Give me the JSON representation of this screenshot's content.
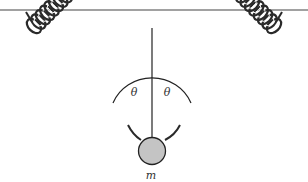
{
  "diagram": {
    "labels": {
      "angle_left": "θ",
      "angle_right": "θ",
      "mass": "m"
    },
    "colors": {
      "line": "#222222",
      "spring": "#2a2a2a",
      "mass_fill": "#c4c4c4",
      "background": "#ffffff"
    },
    "elements": {
      "ceiling": "horizontal support line",
      "left_spring": "coiled spring from upper-left ceiling to mass",
      "right_spring": "coiled spring from upper-right ceiling to mass",
      "vertical_reference": "vertical dashed-free reference line through mass",
      "angle_arc": "arc marking angle theta on each side of vertical",
      "mass": "gray ball of mass m"
    }
  }
}
